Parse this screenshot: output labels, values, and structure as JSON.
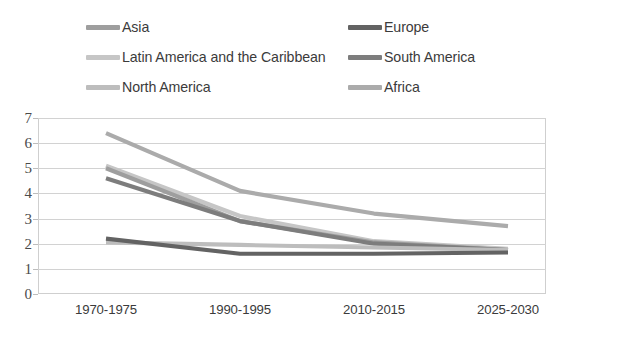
{
  "legend": {
    "rows": [
      [
        {
          "label": "Asia",
          "color": "#9e9e9e",
          "key": "asia"
        },
        {
          "label": "Europe",
          "color": "#636363",
          "key": "europe"
        }
      ],
      [
        {
          "label": "Latin America and the Caribbean",
          "color": "#c6c6c6",
          "key": "latin_america"
        },
        {
          "label": "South America",
          "color": "#7d7d7d",
          "key": "south_america"
        }
      ],
      [
        {
          "label": "North America",
          "color": "#bdbdbd",
          "key": "north_america"
        },
        {
          "label": "Africa",
          "color": "#ababab",
          "key": "africa"
        }
      ]
    ]
  },
  "axes": {
    "y_ticks": [
      "7",
      "6",
      "5",
      "4",
      "3",
      "2",
      "1",
      "0"
    ],
    "x_ticks": [
      "1970-1975",
      "1990-1995",
      "2010-2015",
      "2025-2030"
    ]
  },
  "chart_data": {
    "type": "line",
    "title": "",
    "subtitle": "",
    "xlabel": "",
    "ylabel": "",
    "categories": [
      "1970-1975",
      "1990-1995",
      "2010-2015",
      "2025-2030"
    ],
    "ylim": [
      0,
      7
    ],
    "xlim_categories": 4,
    "grid": true,
    "legend_position": "top",
    "series": [
      {
        "name": "Africa",
        "color": "#ababab",
        "values": [
          6.4,
          4.1,
          3.2,
          2.7
        ]
      },
      {
        "name": "Latin America and the Caribbean",
        "color": "#c6c6c6",
        "values": [
          5.1,
          3.1,
          2.1,
          1.8
        ]
      },
      {
        "name": "Asia",
        "color": "#9e9e9e",
        "values": [
          5.0,
          2.9,
          2.05,
          1.75
        ]
      },
      {
        "name": "South America",
        "color": "#7d7d7d",
        "values": [
          4.6,
          2.9,
          2.0,
          1.75
        ]
      },
      {
        "name": "North America",
        "color": "#bdbdbd",
        "values": [
          2.05,
          1.95,
          1.85,
          1.75
        ]
      },
      {
        "name": "Europe",
        "color": "#636363",
        "values": [
          2.2,
          1.6,
          1.6,
          1.65
        ]
      }
    ]
  },
  "caption": ""
}
